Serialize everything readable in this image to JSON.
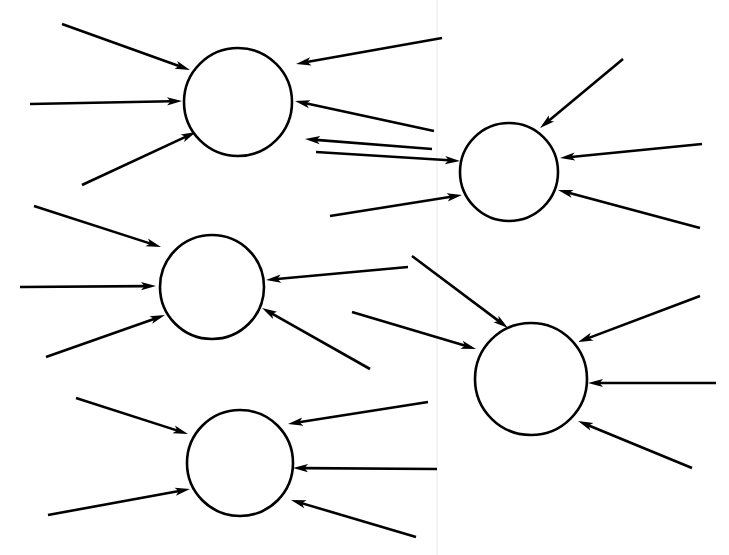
{
  "document": {
    "title": "Node diagram with incoming arrows",
    "background_color": "#ffffff",
    "ink_color": "#000000",
    "width": 729,
    "height": 555,
    "header_fragment": "",
    "page_seam_x": 437,
    "page_seam_color": "#f0f0f2"
  },
  "diagram": {
    "type": "node-arrow-diagram",
    "stroke_width": 2.6,
    "node_count": 5,
    "arrow_count": 27,
    "nodes": [
      {
        "id": "node-1",
        "label": "",
        "cx": 238,
        "cy": 102,
        "r": 54,
        "incoming": 6
      },
      {
        "id": "node-2",
        "label": "",
        "cx": 509,
        "cy": 172,
        "r": 49,
        "incoming": 5
      },
      {
        "id": "node-3",
        "label": "",
        "cx": 212,
        "cy": 287,
        "r": 52,
        "incoming": 5
      },
      {
        "id": "node-4",
        "label": "",
        "cx": 531,
        "cy": 379,
        "r": 56,
        "incoming": 6
      },
      {
        "id": "node-5",
        "label": "",
        "cx": 240,
        "cy": 463,
        "r": 53,
        "incoming": 5
      }
    ],
    "arrows": [
      {
        "id": "a1",
        "target": "node-1",
        "x1": 62,
        "y1": 24,
        "x2": 190,
        "y2": 70
      },
      {
        "id": "a2",
        "target": "node-1",
        "x1": 30,
        "y1": 104,
        "x2": 182,
        "y2": 101
      },
      {
        "id": "a3",
        "target": "node-1",
        "x1": 82,
        "y1": 185,
        "x2": 196,
        "y2": 132
      },
      {
        "id": "a4",
        "target": "node-1",
        "x1": 442,
        "y1": 38,
        "x2": 296,
        "y2": 64
      },
      {
        "id": "a5",
        "target": "node-1",
        "x1": 434,
        "y1": 131,
        "x2": 295,
        "y2": 101
      },
      {
        "id": "a6",
        "target": "node-1",
        "x1": 432,
        "y1": 149,
        "x2": 305,
        "y2": 139
      },
      {
        "id": "a7",
        "target": "node-2",
        "x1": 623,
        "y1": 59,
        "x2": 540,
        "y2": 128
      },
      {
        "id": "a8",
        "target": "node-2",
        "x1": 316,
        "y1": 152,
        "x2": 460,
        "y2": 161
      },
      {
        "id": "a9",
        "target": "node-2",
        "x1": 702,
        "y1": 144,
        "x2": 560,
        "y2": 158
      },
      {
        "id": "a10",
        "target": "node-2",
        "x1": 330,
        "y1": 216,
        "x2": 462,
        "y2": 195
      },
      {
        "id": "a11",
        "target": "node-2",
        "x1": 700,
        "y1": 228,
        "x2": 558,
        "y2": 190
      },
      {
        "id": "a12",
        "target": "node-3",
        "x1": 34,
        "y1": 206,
        "x2": 161,
        "y2": 247
      },
      {
        "id": "a13",
        "target": "node-3",
        "x1": 20,
        "y1": 287,
        "x2": 156,
        "y2": 286
      },
      {
        "id": "a14",
        "target": "node-3",
        "x1": 46,
        "y1": 357,
        "x2": 165,
        "y2": 315
      },
      {
        "id": "a15",
        "target": "node-3",
        "x1": 408,
        "y1": 267,
        "x2": 266,
        "y2": 280
      },
      {
        "id": "a16",
        "target": "node-3",
        "x1": 370,
        "y1": 369,
        "x2": 262,
        "y2": 308
      },
      {
        "id": "a17",
        "target": "node-4",
        "x1": 412,
        "y1": 256,
        "x2": 508,
        "y2": 328
      },
      {
        "id": "a18",
        "target": "node-4",
        "x1": 352,
        "y1": 312,
        "x2": 476,
        "y2": 349
      },
      {
        "id": "a19",
        "target": "node-4",
        "x1": 700,
        "y1": 296,
        "x2": 578,
        "y2": 342
      },
      {
        "id": "a20",
        "target": "node-4",
        "x1": 716,
        "y1": 383,
        "x2": 588,
        "y2": 383
      },
      {
        "id": "a21",
        "target": "node-4",
        "x1": 692,
        "y1": 468,
        "x2": 578,
        "y2": 421
      },
      {
        "id": "a22",
        "target": "node-5",
        "x1": 76,
        "y1": 398,
        "x2": 188,
        "y2": 434
      },
      {
        "id": "a23",
        "target": "node-5",
        "x1": 48,
        "y1": 515,
        "x2": 190,
        "y2": 489
      },
      {
        "id": "a24",
        "target": "node-5",
        "x1": 428,
        "y1": 402,
        "x2": 288,
        "y2": 424
      },
      {
        "id": "a25",
        "target": "node-5",
        "x1": 437,
        "y1": 469,
        "x2": 293,
        "y2": 468
      },
      {
        "id": "a26",
        "target": "node-5",
        "x1": 416,
        "y1": 537,
        "x2": 291,
        "y2": 500
      }
    ]
  }
}
